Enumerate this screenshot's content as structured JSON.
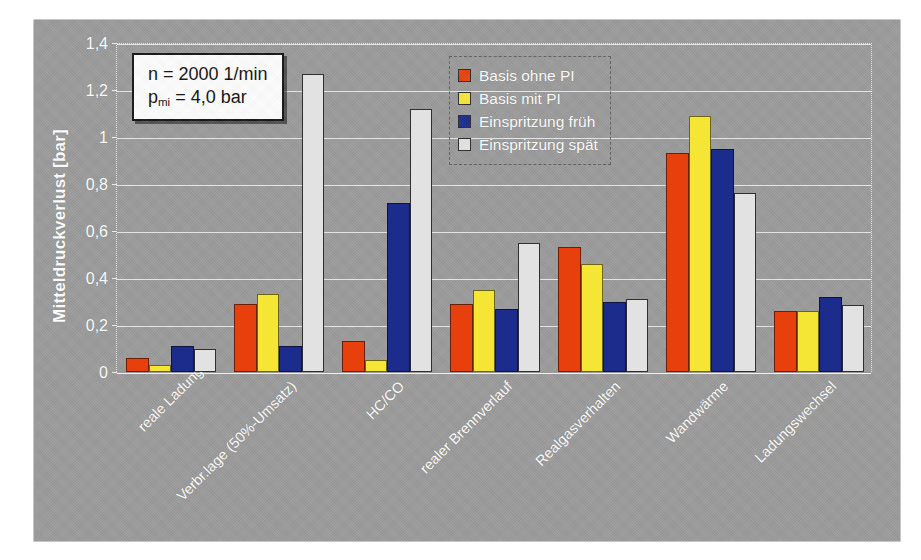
{
  "chart_data": {
    "type": "bar",
    "title": "",
    "xlabel": "",
    "ylabel": "Mitteldruckverlust [bar]",
    "ylim": [
      0,
      1.4
    ],
    "ytick_step": 0.2,
    "ytick_labels": [
      "0",
      "0,2",
      "0,4",
      "0,6",
      "0,8",
      "1",
      "1,2",
      "1,4"
    ],
    "ytick_values": [
      0,
      0.2,
      0.4,
      0.6,
      0.8,
      1.0,
      1.2,
      1.4
    ],
    "grid": true,
    "legend_position": "top-center",
    "categories": [
      "reale Ladung",
      "Verbr.lage (50%-Umsatz)",
      "HC/CO",
      "realer Brennverlauf",
      "Realgasverhalten",
      "Wandwärme",
      "Ladungswechsel"
    ],
    "series": [
      {
        "name": "Basis ohne PI",
        "color": "#e8400c",
        "values": [
          0.06,
          0.29,
          0.13,
          0.29,
          0.53,
          0.93,
          0.26
        ]
      },
      {
        "name": "Basis mit PI",
        "color": "#f5e636",
        "values": [
          0.03,
          0.33,
          0.05,
          0.35,
          0.46,
          1.09,
          0.26
        ]
      },
      {
        "name": "Einspritzung früh",
        "color": "#1b2c8c",
        "values": [
          0.11,
          0.11,
          0.72,
          0.27,
          0.3,
          0.95,
          0.32
        ]
      },
      {
        "name": "Einspritzung spät",
        "color": "#e2e2e2",
        "values": [
          0.1,
          1.27,
          1.12,
          0.55,
          0.31,
          0.76,
          0.285
        ]
      }
    ],
    "annotations": [
      {
        "name": "operating-point",
        "line1": "n = 2000 1/min",
        "line2_pre": "p",
        "line2_sub": "mi",
        "line2_post": " = 4,0 bar"
      }
    ],
    "colors": {
      "plot_background": "#9a9a9a",
      "page_background": "#ffffff",
      "gridline": "#f5f5f5",
      "axis_text": "#ffffff",
      "annotation_background": "#fdfdfd",
      "annotation_border": "#141414"
    }
  }
}
